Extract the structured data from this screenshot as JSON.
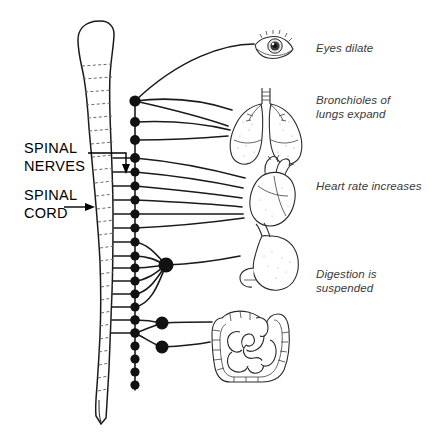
{
  "diagram": {
    "background_color": "#ffffff",
    "ink_color": "#1a1a1a",
    "label_color": "#3a3a3a",
    "structure_labels": [
      {
        "id": "spinal-nerves",
        "line1": "SPINAL",
        "line2": "NERVES",
        "pointer": "down-arrow"
      },
      {
        "id": "spinal-cord",
        "line1": "SPINAL",
        "line2": "CORD",
        "pointer": "right-arrow"
      }
    ],
    "organs": [
      {
        "id": "eye",
        "icon": "eye-icon",
        "label_lines": [
          "Eyes dilate"
        ],
        "label_x": 316,
        "label_y": 52
      },
      {
        "id": "lungs",
        "icon": "lungs-icon",
        "label_lines": [
          "Bronchioles of",
          "lungs expand"
        ],
        "label_x": 316,
        "label_y": 104
      },
      {
        "id": "heart",
        "icon": "heart-icon",
        "label_lines": [
          "Heart rate increases"
        ],
        "label_x": 316,
        "label_y": 190
      },
      {
        "id": "stomach",
        "icon": "stomach-icon",
        "label_lines": [
          "Digestion is",
          "suspended"
        ],
        "label_x": 316,
        "label_y": 278
      },
      {
        "id": "intestines",
        "icon": "intestines-icon",
        "label_lines": [],
        "label_x": 0,
        "label_y": 0
      }
    ],
    "chain": {
      "name": "sympathetic-ganglion-chain",
      "x": 135,
      "small_ganglia_y": [
        101,
        122,
        140,
        158,
        172,
        186,
        200,
        214,
        228,
        242,
        256,
        268,
        281,
        294,
        307,
        320,
        333,
        346,
        359,
        372,
        385
      ],
      "prevertebral_ganglia": [
        {
          "x": 166,
          "y": 265,
          "r": 7.5
        },
        {
          "x": 162,
          "y": 323,
          "r": 6.5
        },
        {
          "x": 162,
          "y": 347,
          "r": 6.5
        }
      ]
    },
    "spine": {
      "name": "vertebral-column",
      "vertebra_count": 24
    }
  }
}
